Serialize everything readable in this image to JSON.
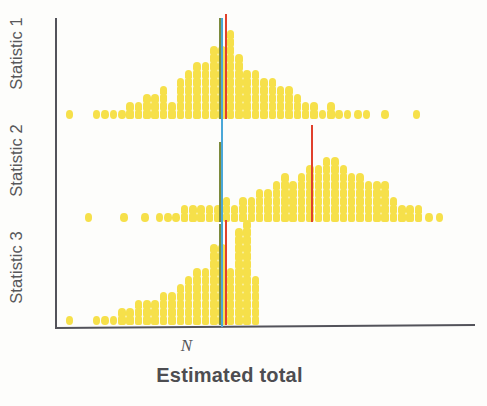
{
  "figure": {
    "background": "#fdfdfb",
    "axis_color": "#53535a",
    "dot_color": "#f6e04a"
  },
  "axes": {
    "y_group_labels": [
      {
        "label": "Statistic 1"
      },
      {
        "label": "Statistic 2"
      },
      {
        "label": "Statistic 3"
      }
    ],
    "x_tick_label": "N",
    "x_title": "Estimated total"
  },
  "reference_lines": {
    "truth_blue": {
      "color": "#4aa7d8",
      "x_value": "N",
      "name": "true-total-line"
    },
    "median_green": {
      "color": "#7c8a3c",
      "name": "median-line"
    },
    "mean_red": {
      "color": "#e0402c",
      "name": "mean-line"
    }
  },
  "chart_data": {
    "type": "scatter",
    "title": "",
    "xlabel": "Estimated total",
    "ylabel": "",
    "subtitle": "Dot-density (stacked dot) distributions of estimated total for three statistics",
    "xlim": [
      0,
      100
    ],
    "ylim": [
      0,
      3
    ],
    "grid": false,
    "legend_position": "none",
    "xticks": [
      {
        "value": 39.5,
        "label": "N"
      }
    ],
    "panels": [
      {
        "name": "Statistic 1",
        "reference_lines": {
          "truth_blue_x": 39.5,
          "median_green_x": 39.0,
          "mean_red_x": 40.5
        },
        "dot_unit_px": 8,
        "bins": [
          {
            "x": 3.0,
            "count": 1
          },
          {
            "x": 9.5,
            "count": 1
          },
          {
            "x": 11.5,
            "count": 1
          },
          {
            "x": 13.5,
            "count": 1
          },
          {
            "x": 15.5,
            "count": 1
          },
          {
            "x": 17.5,
            "count": 2
          },
          {
            "x": 19.5,
            "count": 2
          },
          {
            "x": 21.5,
            "count": 3
          },
          {
            "x": 23.5,
            "count": 3
          },
          {
            "x": 25.5,
            "count": 4
          },
          {
            "x": 27.5,
            "count": 2
          },
          {
            "x": 29.5,
            "count": 5
          },
          {
            "x": 31.5,
            "count": 6
          },
          {
            "x": 33.5,
            "count": 7
          },
          {
            "x": 35.5,
            "count": 7
          },
          {
            "x": 37.5,
            "count": 9
          },
          {
            "x": 39.5,
            "count": 9
          },
          {
            "x": 41.5,
            "count": 11
          },
          {
            "x": 43.5,
            "count": 8
          },
          {
            "x": 45.5,
            "count": 6
          },
          {
            "x": 47.5,
            "count": 6
          },
          {
            "x": 49.5,
            "count": 5
          },
          {
            "x": 51.5,
            "count": 5
          },
          {
            "x": 53.5,
            "count": 4
          },
          {
            "x": 55.5,
            "count": 4
          },
          {
            "x": 57.5,
            "count": 3
          },
          {
            "x": 59.5,
            "count": 2
          },
          {
            "x": 61.5,
            "count": 2
          },
          {
            "x": 63.5,
            "count": 1
          },
          {
            "x": 65.5,
            "count": 2
          },
          {
            "x": 67.5,
            "count": 1
          },
          {
            "x": 69.5,
            "count": 1
          },
          {
            "x": 72.0,
            "count": 1
          },
          {
            "x": 74.0,
            "count": 1
          },
          {
            "x": 78.5,
            "count": 1
          },
          {
            "x": 86.0,
            "count": 1
          }
        ]
      },
      {
        "name": "Statistic 2",
        "reference_lines": {
          "truth_blue_x": 39.5,
          "median_green_x": 39.0,
          "mean_red_x": 61.0
        },
        "dot_unit_px": 8,
        "bins": [
          {
            "x": 7.5,
            "count": 1
          },
          {
            "x": 16.0,
            "count": 1
          },
          {
            "x": 21.0,
            "count": 1
          },
          {
            "x": 24.5,
            "count": 1
          },
          {
            "x": 26.5,
            "count": 1
          },
          {
            "x": 28.5,
            "count": 1
          },
          {
            "x": 30.5,
            "count": 2
          },
          {
            "x": 32.5,
            "count": 2
          },
          {
            "x": 34.5,
            "count": 2
          },
          {
            "x": 36.5,
            "count": 2
          },
          {
            "x": 38.5,
            "count": 2
          },
          {
            "x": 40.5,
            "count": 3
          },
          {
            "x": 42.5,
            "count": 2
          },
          {
            "x": 44.5,
            "count": 3
          },
          {
            "x": 46.5,
            "count": 3
          },
          {
            "x": 48.5,
            "count": 4
          },
          {
            "x": 50.5,
            "count": 4
          },
          {
            "x": 52.5,
            "count": 5
          },
          {
            "x": 54.5,
            "count": 6
          },
          {
            "x": 56.5,
            "count": 5
          },
          {
            "x": 58.5,
            "count": 6
          },
          {
            "x": 60.5,
            "count": 7
          },
          {
            "x": 62.5,
            "count": 7
          },
          {
            "x": 64.5,
            "count": 8
          },
          {
            "x": 66.5,
            "count": 8
          },
          {
            "x": 68.5,
            "count": 7
          },
          {
            "x": 70.5,
            "count": 6
          },
          {
            "x": 72.5,
            "count": 6
          },
          {
            "x": 74.5,
            "count": 5
          },
          {
            "x": 76.5,
            "count": 5
          },
          {
            "x": 78.5,
            "count": 5
          },
          {
            "x": 80.5,
            "count": 3
          },
          {
            "x": 82.5,
            "count": 2
          },
          {
            "x": 84.5,
            "count": 2
          },
          {
            "x": 86.5,
            "count": 2
          },
          {
            "x": 89.0,
            "count": 1
          },
          {
            "x": 91.5,
            "count": 1
          }
        ]
      },
      {
        "name": "Statistic 3",
        "reference_lines": {
          "truth_blue_x": 39.5,
          "median_green_x": 39.0,
          "mean_red_x": 40.5
        },
        "dot_unit_px": 8,
        "bins": [
          {
            "x": 3.0,
            "count": 1
          },
          {
            "x": 9.5,
            "count": 1
          },
          {
            "x": 11.5,
            "count": 1
          },
          {
            "x": 13.5,
            "count": 1
          },
          {
            "x": 15.5,
            "count": 2
          },
          {
            "x": 17.5,
            "count": 2
          },
          {
            "x": 19.5,
            "count": 3
          },
          {
            "x": 21.5,
            "count": 3
          },
          {
            "x": 23.5,
            "count": 3
          },
          {
            "x": 25.5,
            "count": 4
          },
          {
            "x": 27.5,
            "count": 4
          },
          {
            "x": 29.5,
            "count": 5
          },
          {
            "x": 31.5,
            "count": 6
          },
          {
            "x": 33.5,
            "count": 7
          },
          {
            "x": 35.5,
            "count": 7
          },
          {
            "x": 37.5,
            "count": 10
          },
          {
            "x": 39.5,
            "count": 10
          },
          {
            "x": 41.5,
            "count": 7
          },
          {
            "x": 43.5,
            "count": 12
          },
          {
            "x": 45.5,
            "count": 13
          },
          {
            "x": 47.5,
            "count": 6
          }
        ]
      }
    ]
  }
}
